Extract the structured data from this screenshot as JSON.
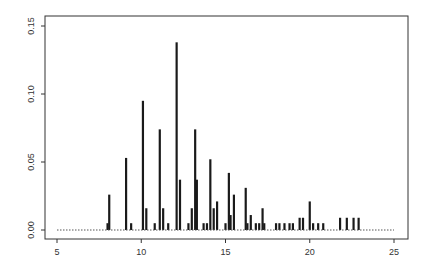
{
  "chart_data": {
    "type": "bar",
    "subtype": "spike",
    "title": "",
    "xlabel": "",
    "ylabel": "",
    "xlim": [
      5,
      25
    ],
    "ylim": [
      0,
      0.155
    ],
    "grid": false,
    "legend": null,
    "baseline": {
      "from": 5,
      "to": 25,
      "style": "dotted"
    },
    "xticks": [
      5,
      10,
      15,
      20,
      25
    ],
    "yticks": [
      0.0,
      0.05,
      0.1,
      0.15
    ],
    "xtick_labels": [
      "5",
      "10",
      "15",
      "20",
      "25"
    ],
    "ytick_labels": [
      "0.00",
      "0.05",
      "0.10",
      "0.15"
    ],
    "x": [
      8.0,
      8.1,
      9.1,
      9.4,
      10.1,
      10.3,
      10.8,
      11.1,
      11.3,
      11.6,
      12.1,
      12.3,
      12.8,
      13.0,
      13.2,
      13.3,
      13.7,
      13.9,
      14.1,
      14.3,
      14.5,
      15.0,
      15.2,
      15.3,
      15.5,
      16.2,
      16.3,
      16.5,
      16.8,
      17.0,
      17.2,
      17.3,
      18.0,
      18.2,
      18.5,
      18.8,
      19.0,
      19.4,
      19.6,
      20.0,
      20.2,
      20.5,
      20.8,
      21.8,
      22.2,
      22.6,
      22.9
    ],
    "values": [
      0.005,
      0.026,
      0.053,
      0.005,
      0.095,
      0.016,
      0.005,
      0.074,
      0.016,
      0.005,
      0.138,
      0.037,
      0.005,
      0.016,
      0.074,
      0.037,
      0.005,
      0.005,
      0.052,
      0.016,
      0.021,
      0.005,
      0.042,
      0.011,
      0.026,
      0.031,
      0.005,
      0.011,
      0.005,
      0.005,
      0.016,
      0.005,
      0.005,
      0.005,
      0.005,
      0.005,
      0.005,
      0.009,
      0.009,
      0.021,
      0.005,
      0.005,
      0.005,
      0.009,
      0.009,
      0.009,
      0.009
    ]
  },
  "colors": {
    "bar": "#1a1a1a",
    "axis": "#333333",
    "baseline": "#555555"
  }
}
